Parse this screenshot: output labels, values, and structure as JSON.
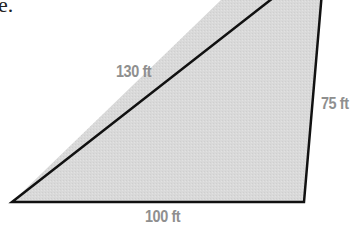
{
  "caption_fragment": "e.",
  "figure": {
    "shape": "triangle",
    "fill_color": "#d8d8d8",
    "stroke_color": "#111111",
    "sides": {
      "hypotenuse": "130 ft",
      "right_side": "75 ft",
      "base": "100 ft"
    },
    "label_color": "#8f8f8f"
  }
}
